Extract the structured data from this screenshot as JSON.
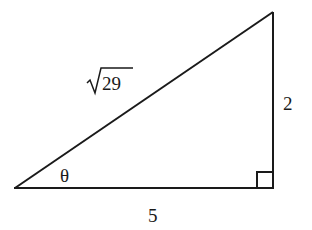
{
  "diagram": {
    "type": "right-triangle",
    "vertices": {
      "left": {
        "x": 15,
        "y": 188
      },
      "right_angle": {
        "x": 273,
        "y": 188
      },
      "top": {
        "x": 273,
        "y": 12
      }
    },
    "labels": {
      "hypotenuse": "29",
      "hypotenuse_radical": "√",
      "vertical_leg": "2",
      "horizontal_leg": "5",
      "angle": "θ"
    },
    "right_angle_marker": true,
    "stroke_color": "#1a1a1a",
    "background_color": "#ffffff"
  }
}
